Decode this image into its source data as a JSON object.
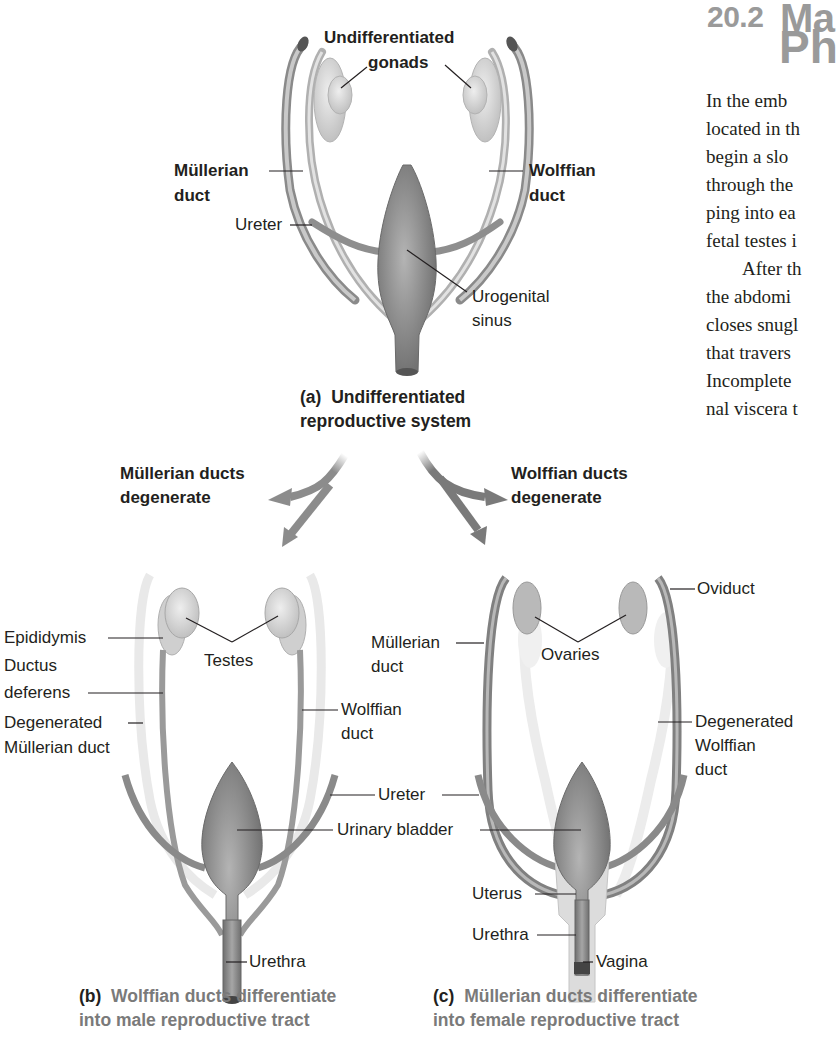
{
  "page": {
    "section_number": "20.2",
    "section_title_line1": "Ma",
    "section_title_line2": "Ph",
    "body_lines": [
      "In the emb",
      "located in th",
      "begin a slo",
      "through the",
      "ping into ea",
      "fetal testes i",
      "After th",
      "the abdomi",
      "closes snugl",
      "that travers",
      "Incomplete",
      "nal viscera t"
    ]
  },
  "figure": {
    "panel_a": {
      "caption_letter": "(a)",
      "caption_line1": "Undifferentiated",
      "caption_line2": "reproductive system",
      "labels": {
        "gonads_line1": "Undifferentiated",
        "gonads_line2": "gonads",
        "mullerian_line1": "Müllerian",
        "mullerian_line2": "duct",
        "wolffian_line1": "Wolffian",
        "wolffian_line2": "duct",
        "ureter": "Ureter",
        "sinus_line1": "Urogenital",
        "sinus_line2": "sinus"
      }
    },
    "arrows": {
      "left_line1": "Müllerian ducts",
      "left_line2": "degenerate",
      "right_line1": "Wolffian ducts",
      "right_line2": "degenerate"
    },
    "panel_b": {
      "caption_letter": "(b)",
      "caption_line1": "Wolffian ducts differentiate",
      "caption_line2": "into male reproductive tract",
      "labels": {
        "epididymis": "Epididymis",
        "ductus_line1": "Ductus",
        "ductus_line2": "deferens",
        "degen_line1": "Degenerated",
        "degen_line2": "Müllerian duct",
        "testes": "Testes",
        "wolffian_line1": "Wolffian",
        "wolffian_line2": "duct",
        "urethra": "Urethra"
      }
    },
    "shared_labels": {
      "ureter": "Ureter",
      "urinary_bladder": "Urinary bladder"
    },
    "panel_c": {
      "caption_letter": "(c)",
      "caption_line1": "Müllerian ducts differentiate",
      "caption_line2": "into female reproductive tract",
      "labels": {
        "oviduct": "Oviduct",
        "mullerian_line1": "Müllerian",
        "mullerian_line2": "duct",
        "ovaries": "Ovaries",
        "degen_line1": "Degenerated",
        "degen_line2": "Wolffian",
        "degen_line3": "duct",
        "uterus": "Uterus",
        "urethra": "Urethra",
        "vagina": "Vagina"
      }
    },
    "colors": {
      "organ_dark": "#7d7d7d",
      "organ_mid": "#a8a8a8",
      "organ_light": "#d6d6d6",
      "faded": "#e6e6e6",
      "caption_grey": "#7a7a7a",
      "heading_grey": "#9a9a9a"
    }
  }
}
